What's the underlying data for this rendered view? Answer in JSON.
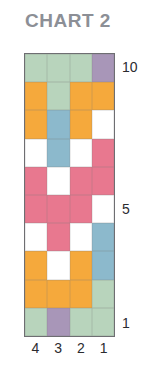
{
  "title": "CHART 2",
  "colors": {
    "green": "#b8d4bc",
    "purple": "#a896b8",
    "orange": "#f5a93c",
    "blue": "#8cb9cc",
    "pink": "#e8788f",
    "white": "#ffffff",
    "border": "#6e6e72",
    "title_text": "#8c8f96",
    "axis_text": "#2b2b2f"
  },
  "axes": {
    "row_labels": [
      {
        "value": "10",
        "row": 10
      },
      {
        "value": "5",
        "row": 5
      },
      {
        "value": "1",
        "row": 1
      }
    ],
    "column_labels": [
      "4",
      "3",
      "2",
      "1"
    ]
  },
  "chart_data": {
    "type": "heatmap",
    "title": "CHART 2",
    "xlabel": "",
    "ylabel": "",
    "grid": true,
    "legend": "none",
    "ncols": 4,
    "nrows": 10,
    "categories": [
      "4",
      "3",
      "2",
      "1"
    ],
    "row_ticks": [
      "10",
      "5",
      "1"
    ],
    "row_order_top_to_bottom": [
      10,
      9,
      8,
      7,
      6,
      5,
      4,
      3,
      2,
      1
    ],
    "palette": {
      "green": "#b8d4bc",
      "purple": "#a896b8",
      "orange": "#f5a93c",
      "blue": "#8cb9cc",
      "pink": "#e8788f",
      "white": "#ffffff"
    },
    "rows": [
      {
        "row": 10,
        "cells": [
          "green",
          "green",
          "green",
          "purple"
        ]
      },
      {
        "row": 9,
        "cells": [
          "orange",
          "green",
          "orange",
          "orange"
        ]
      },
      {
        "row": 8,
        "cells": [
          "orange",
          "blue",
          "orange",
          "white"
        ]
      },
      {
        "row": 7,
        "cells": [
          "white",
          "blue",
          "white",
          "pink"
        ]
      },
      {
        "row": 6,
        "cells": [
          "pink",
          "white",
          "pink",
          "pink"
        ]
      },
      {
        "row": 5,
        "cells": [
          "pink",
          "pink",
          "pink",
          "white"
        ]
      },
      {
        "row": 4,
        "cells": [
          "white",
          "pink",
          "white",
          "blue"
        ]
      },
      {
        "row": 3,
        "cells": [
          "orange",
          "white",
          "orange",
          "blue"
        ]
      },
      {
        "row": 2,
        "cells": [
          "orange",
          "orange",
          "orange",
          "green"
        ]
      },
      {
        "row": 1,
        "cells": [
          "green",
          "purple",
          "green",
          "green"
        ]
      }
    ]
  }
}
